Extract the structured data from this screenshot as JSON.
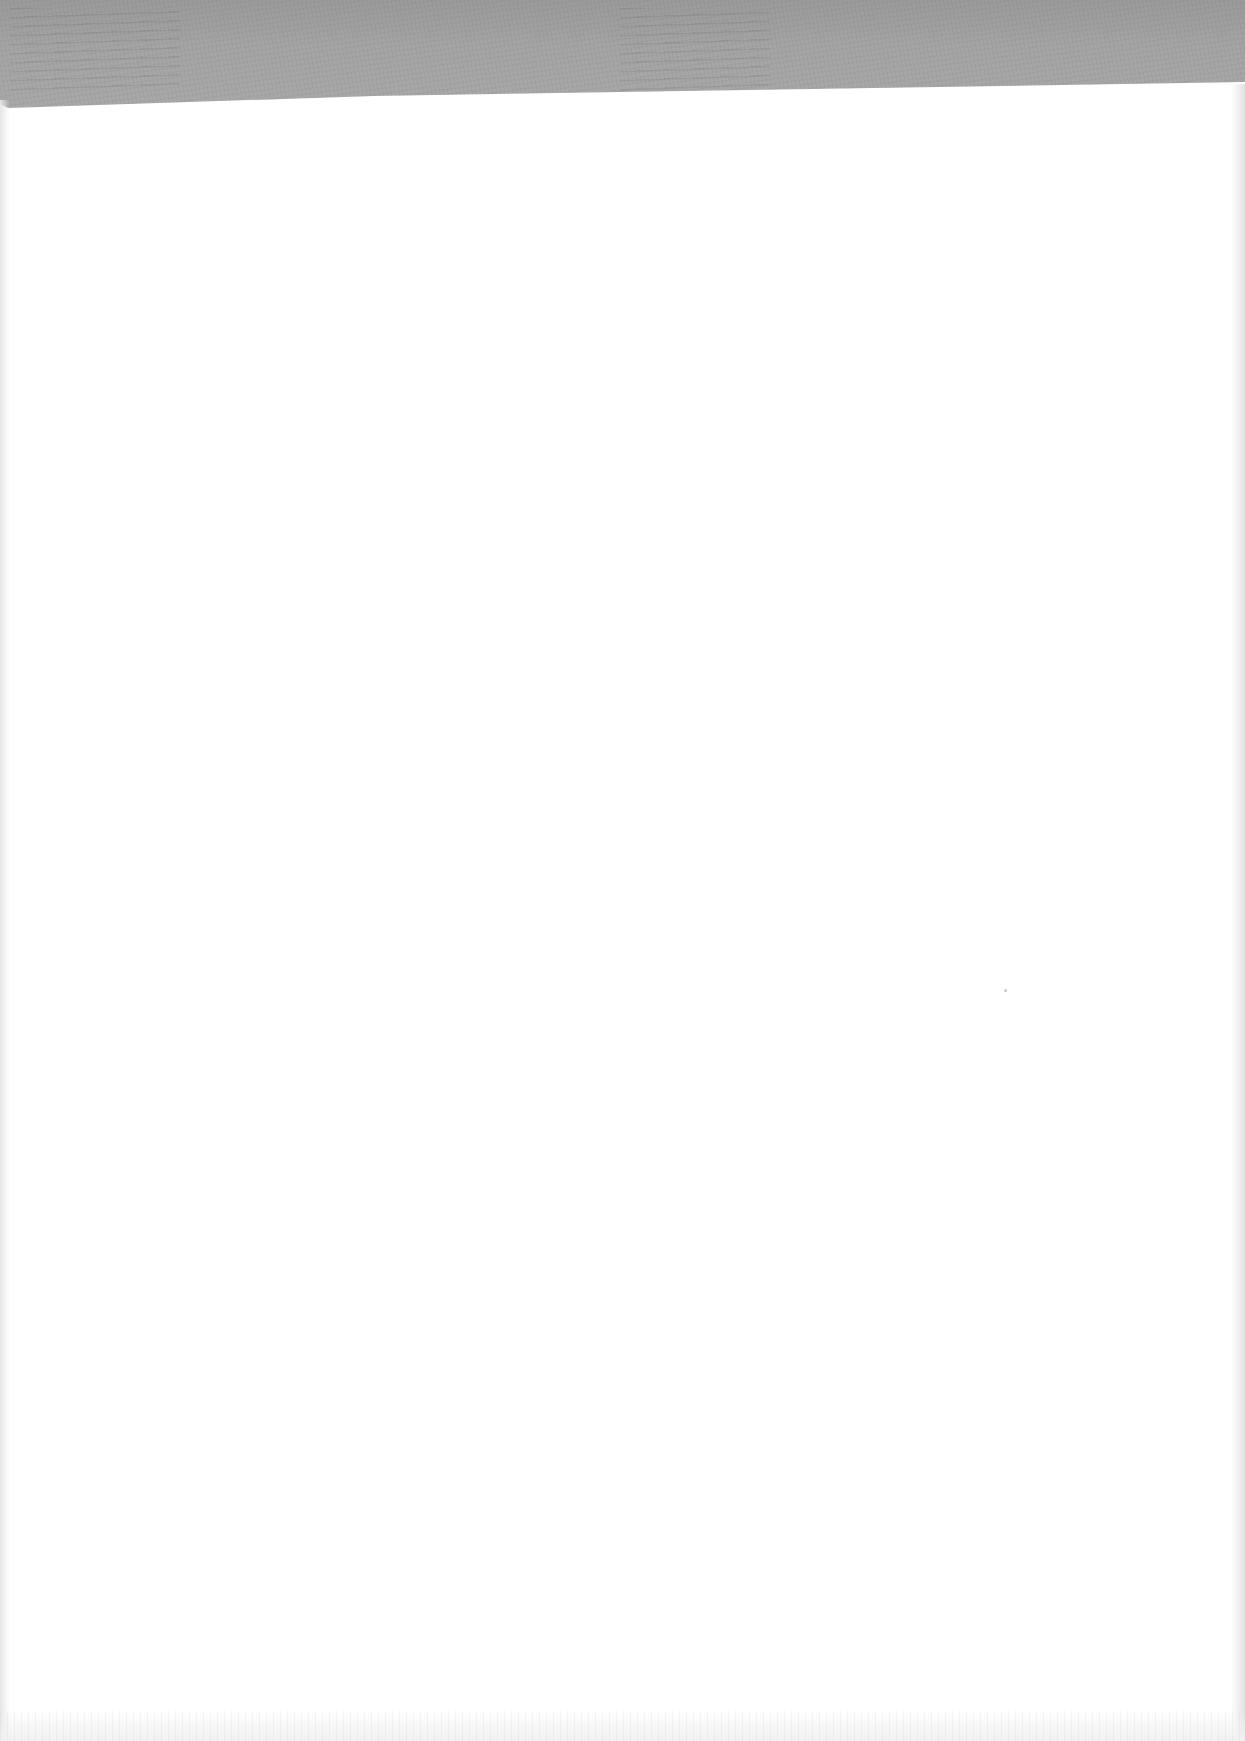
{
  "document": {
    "type": "blank-scanned-page",
    "colors": {
      "page_background": "#ffffff",
      "top_band": "#a4a4a4",
      "edge_shadow": "#e4e4e4"
    },
    "text_content": []
  }
}
